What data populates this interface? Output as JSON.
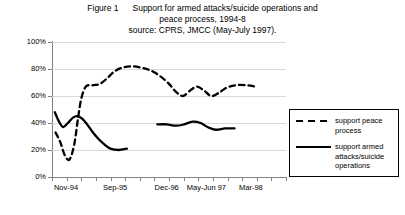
{
  "title": {
    "figure_label": "Figure 1",
    "line1": "Support for armed attacks/suicide operations and",
    "line2": "peace process, 1994-8",
    "line3": "source: CPRS, JMCC (May-July 1997)."
  },
  "legend": {
    "items": [
      {
        "label": "support peace process",
        "style": "dashed",
        "color": "#000000"
      },
      {
        "label": "support armed attacks/suicide operations",
        "style": "solid",
        "color": "#000000"
      }
    ]
  },
  "axes": {
    "y_ticks": [
      "0%",
      "20%",
      "40%",
      "60%",
      "80%",
      "100%"
    ],
    "x_ticks": [
      "Nov-94",
      "Sep-95",
      "Dec-96",
      "May-Jun 97",
      "Mar-98"
    ]
  },
  "chart_data": {
    "type": "line",
    "title": "Support for armed attacks/suicide operations and peace process, 1994-8",
    "subtitle": "source: CPRS, JMCC (May-July 1997).",
    "xlabel": "",
    "ylabel": "",
    "ylim": [
      0,
      100
    ],
    "ytick_values": [
      0,
      20,
      40,
      60,
      80,
      100
    ],
    "ytick_labels": [
      "0%",
      "20%",
      "40%",
      "60%",
      "80%",
      "100%"
    ],
    "xtick_labels": [
      "Nov-94",
      "Sep-95",
      "Dec-96",
      "May-Jun 97",
      "Mar-98"
    ],
    "xtick_positions": [
      0.06,
      0.27,
      0.49,
      0.66,
      0.85
    ],
    "grid": true,
    "legend_position": "right",
    "series": [
      {
        "name": "support peace process",
        "style": "dashed",
        "color": "#000000",
        "points": [
          {
            "x": 0.015,
            "y": 33
          },
          {
            "x": 0.035,
            "y": 26
          },
          {
            "x": 0.055,
            "y": 16
          },
          {
            "x": 0.075,
            "y": 13
          },
          {
            "x": 0.095,
            "y": 24
          },
          {
            "x": 0.11,
            "y": 42
          },
          {
            "x": 0.125,
            "y": 58
          },
          {
            "x": 0.145,
            "y": 67
          },
          {
            "x": 0.175,
            "y": 68
          },
          {
            "x": 0.205,
            "y": 69
          },
          {
            "x": 0.235,
            "y": 73
          },
          {
            "x": 0.265,
            "y": 78
          },
          {
            "x": 0.3,
            "y": 81
          },
          {
            "x": 0.34,
            "y": 82
          },
          {
            "x": 0.38,
            "y": 81
          },
          {
            "x": 0.42,
            "y": 79
          },
          {
            "x": 0.46,
            "y": 75
          },
          {
            "x": 0.5,
            "y": 69
          },
          {
            "x": 0.53,
            "y": 63
          },
          {
            "x": 0.56,
            "y": 60
          },
          {
            "x": 0.59,
            "y": 64
          },
          {
            "x": 0.62,
            "y": 67
          },
          {
            "x": 0.65,
            "y": 64
          },
          {
            "x": 0.68,
            "y": 60
          },
          {
            "x": 0.71,
            "y": 62
          },
          {
            "x": 0.745,
            "y": 66
          },
          {
            "x": 0.785,
            "y": 68
          },
          {
            "x": 0.83,
            "y": 68
          },
          {
            "x": 0.87,
            "y": 67
          }
        ]
      },
      {
        "name": "support armed attacks/suicide operations",
        "style": "solid",
        "color": "#000000",
        "segments": [
          [
            {
              "x": 0.012,
              "y": 48
            },
            {
              "x": 0.03,
              "y": 41
            },
            {
              "x": 0.048,
              "y": 37
            },
            {
              "x": 0.068,
              "y": 40
            },
            {
              "x": 0.09,
              "y": 44
            },
            {
              "x": 0.11,
              "y": 45
            },
            {
              "x": 0.13,
              "y": 43
            },
            {
              "x": 0.15,
              "y": 39
            },
            {
              "x": 0.175,
              "y": 33
            },
            {
              "x": 0.2,
              "y": 28
            },
            {
              "x": 0.225,
              "y": 24
            },
            {
              "x": 0.25,
              "y": 21
            },
            {
              "x": 0.285,
              "y": 20
            },
            {
              "x": 0.32,
              "y": 21
            }
          ],
          [
            {
              "x": 0.45,
              "y": 39
            },
            {
              "x": 0.49,
              "y": 39
            },
            {
              "x": 0.53,
              "y": 38
            },
            {
              "x": 0.565,
              "y": 39
            },
            {
              "x": 0.6,
              "y": 41
            },
            {
              "x": 0.635,
              "y": 40
            },
            {
              "x": 0.665,
              "y": 37
            },
            {
              "x": 0.7,
              "y": 35
            },
            {
              "x": 0.74,
              "y": 36
            },
            {
              "x": 0.78,
              "y": 36
            }
          ]
        ]
      }
    ]
  }
}
